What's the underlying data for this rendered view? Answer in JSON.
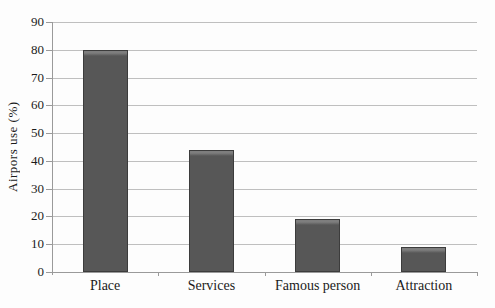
{
  "chart_data": {
    "type": "bar",
    "categories": [
      "Place",
      "Services",
      "Famous person",
      "Attraction"
    ],
    "values": [
      80,
      44,
      19,
      9
    ],
    "title": "",
    "xlabel": "",
    "ylabel": "Airpors use (%)",
    "ylim": [
      0,
      90
    ],
    "ytick_step": 10,
    "yticks": [
      0,
      10,
      20,
      30,
      40,
      50,
      60,
      70,
      80,
      90
    ],
    "grid": true,
    "legend": false,
    "colors": {
      "bar_fill": "#575757",
      "bar_highlight": "#7e7e7e",
      "bar_border": "#3c3c3c",
      "gridline": "#bfbfbf",
      "axis": "#9a9a9a",
      "text": "#1b1b1b",
      "background": "#fdfdfd"
    }
  }
}
